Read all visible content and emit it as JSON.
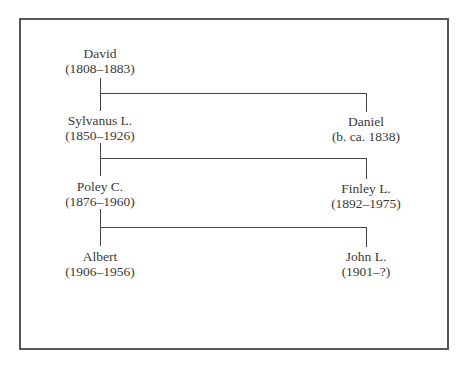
{
  "diagram": {
    "type": "family-tree",
    "left_column": [
      {
        "name": "David",
        "dates": "(1808–1883)"
      },
      {
        "name": "Sylvanus L.",
        "dates": "(1850–1926)"
      },
      {
        "name": "Poley C.",
        "dates": "(1876–1960)"
      },
      {
        "name": "Albert",
        "dates": "(1906–1956)"
      }
    ],
    "right_column": [
      {
        "name": "Daniel",
        "dates": "(b. ca. 1838)"
      },
      {
        "name": "Finley L.",
        "dates": "(1892–1975)"
      },
      {
        "name": "John L.",
        "dates": "(1901–?)"
      }
    ],
    "relations": [
      {
        "parent": "David",
        "children": [
          "Sylvanus L.",
          "Daniel"
        ]
      },
      {
        "parent": "Sylvanus L.",
        "children": [
          "Poley C.",
          "Finley L."
        ]
      },
      {
        "parent": "Poley C.",
        "children": [
          "Albert",
          "John L."
        ]
      }
    ],
    "colors": {
      "line": "#444444",
      "frame": "#555555",
      "text": "#3a3a3a"
    }
  }
}
